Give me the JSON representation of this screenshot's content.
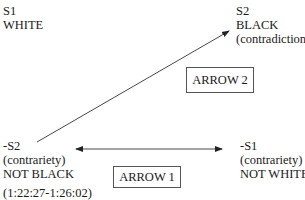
{
  "nodes": {
    "s1": {
      "line1": "S1",
      "line2": "WHITE"
    },
    "s2": {
      "line1": "S2",
      "line2": "BLACK",
      "line3": "(contradiction)"
    },
    "not_s2": {
      "line1": "-S2",
      "line2": "(contrariety)",
      "line3": "NOT BLACK"
    },
    "not_s1": {
      "line1": "-S1",
      "line2": "(contrariety)",
      "line3": "NOT WHITE"
    }
  },
  "arrows": {
    "arrow1_label": "ARROW 1",
    "arrow2_label": "ARROW 2"
  },
  "timestamp": "(1:22:27-1:26:02)",
  "colors": {
    "line": "#222222",
    "box_border": "#555555"
  }
}
